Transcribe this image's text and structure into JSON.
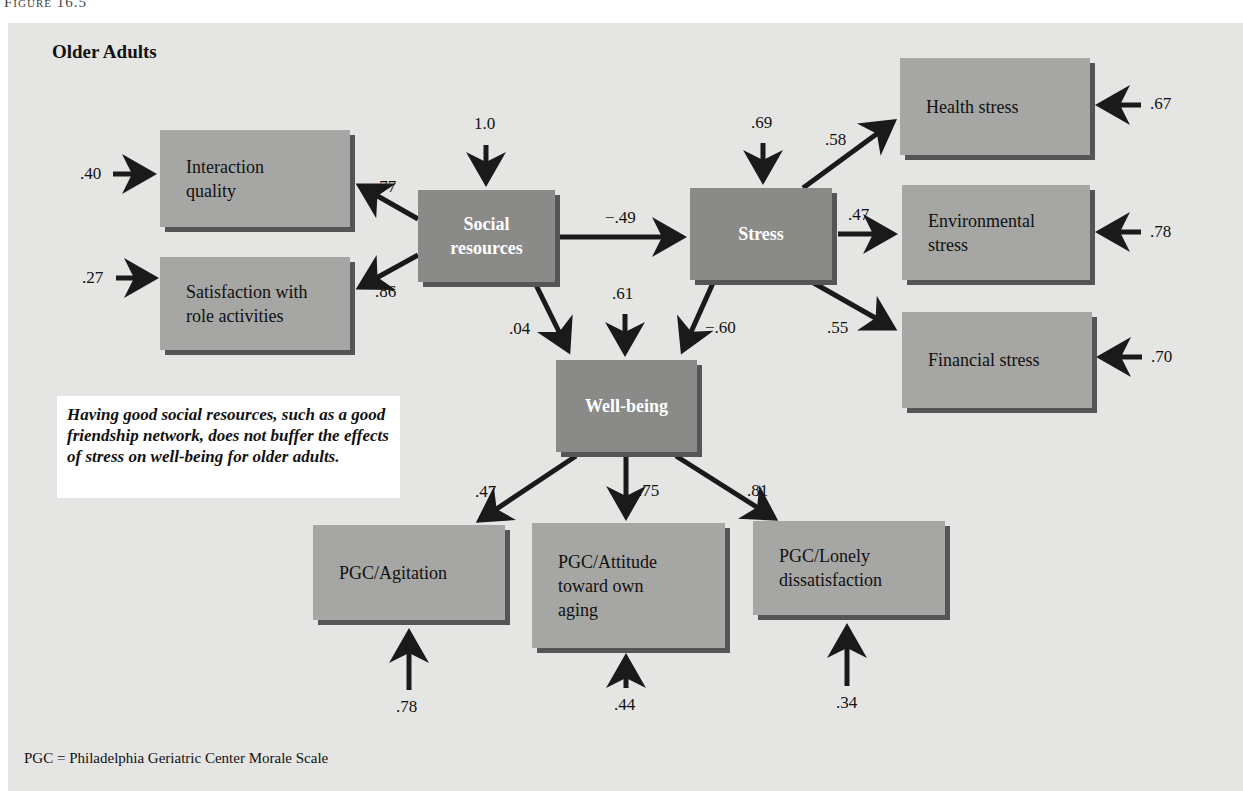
{
  "figure_label": "Figure 16.5",
  "panel_title": "Older Adults",
  "nodes": {
    "interaction_quality": {
      "label": "Interaction\nquality",
      "type": "indicator",
      "error": ".40"
    },
    "satisfaction_role": {
      "label": "Satisfaction with\nrole activities",
      "type": "indicator",
      "error": ".27"
    },
    "social_resources": {
      "label": "Social\nresources",
      "type": "latent",
      "disturbance": "1.0"
    },
    "stress": {
      "label": "Stress",
      "type": "latent",
      "disturbance": ".69"
    },
    "health_stress": {
      "label": "Health stress",
      "type": "indicator",
      "error": ".67"
    },
    "environmental_stress": {
      "label": "Environmental\nstress",
      "type": "indicator",
      "error": ".78"
    },
    "financial_stress": {
      "label": "Financial stress",
      "type": "indicator",
      "error": ".70"
    },
    "well_being": {
      "label": "Well-being",
      "type": "latent",
      "disturbance": ".61"
    },
    "pgc_agitation": {
      "label": "PGC/Agitation",
      "type": "indicator",
      "error": ".78"
    },
    "pgc_attitude": {
      "label": "PGC/Attitude\ntoward own\naging",
      "type": "indicator",
      "error": ".44"
    },
    "pgc_lonely": {
      "label": "PGC/Lonely\ndissatisfaction",
      "type": "indicator",
      "error": ".34"
    }
  },
  "paths": {
    "social_to_interaction": ".77",
    "social_to_satisfaction": ".86",
    "social_to_stress": "−.49",
    "social_to_wellbeing": ".04",
    "stress_to_wellbeing": "−.60",
    "stress_to_health": ".58",
    "stress_to_environmental": ".47",
    "stress_to_financial": ".55",
    "wellbeing_to_agitation": ".47",
    "wellbeing_to_attitude": ".75",
    "wellbeing_to_lonely": ".81"
  },
  "callout": "Having good social resources, such as a good friendship network, does not buffer the effects of stress on well-being for older adults.",
  "footnote": "PGC = Philadelphia Geriatric Center Morale Scale",
  "colors": {
    "panel_bg": "#e5e5e3",
    "indicator_box": "#a6a6a4",
    "latent_box": "#8a8a88",
    "box_shadow": "#555555",
    "arrow": "#1a1a1a"
  }
}
